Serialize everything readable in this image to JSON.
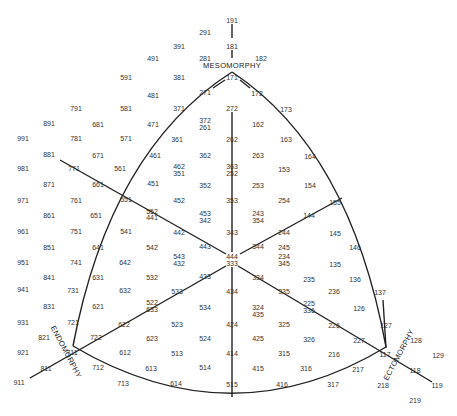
{
  "chart_data": {
    "type": "somatochart",
    "axes": {
      "top": "MESOMORPHY",
      "left": "ENDOMORPHY",
      "right": "ECTOMORPHY"
    },
    "center": "444 / 333",
    "points": [
      {
        "t": "191",
        "x": 232,
        "y": 20
      },
      {
        "t": "291",
        "x": 205,
        "y": 32
      },
      {
        "t": "181",
        "x": 232,
        "y": 46
      },
      {
        "t": "391",
        "x": 179,
        "y": 46
      },
      {
        "t": "491",
        "x": 153,
        "y": 58
      },
      {
        "t": "281",
        "x": 205,
        "y": 58
      },
      {
        "t": "182",
        "x": 261,
        "y": 58
      },
      {
        "t": "591",
        "x": 126,
        "y": 77
      },
      {
        "t": "381",
        "x": 179,
        "y": 77
      },
      {
        "t": "171",
        "x": 232,
        "y": 77
      },
      {
        "t": "481",
        "x": 153,
        "y": 95
      },
      {
        "t": "271",
        "x": 205,
        "y": 92
      },
      {
        "t": "172",
        "x": 257,
        "y": 93
      },
      {
        "t": "173",
        "x": 286,
        "y": 109
      },
      {
        "t": "791",
        "x": 76,
        "y": 108
      },
      {
        "t": "581",
        "x": 126,
        "y": 108
      },
      {
        "t": "371",
        "x": 179,
        "y": 108
      },
      {
        "t": "272",
        "x": 232,
        "y": 108
      },
      {
        "t": "891",
        "x": 49,
        "y": 123
      },
      {
        "t": "681",
        "x": 98,
        "y": 124
      },
      {
        "t": "471",
        "x": 153,
        "y": 124
      },
      {
        "t": "372",
        "x": 205,
        "y": 120
      },
      {
        "t": "261",
        "x": 205,
        "y": 127
      },
      {
        "t": "162",
        "x": 258,
        "y": 124
      },
      {
        "t": "991",
        "x": 23,
        "y": 138
      },
      {
        "t": "781",
        "x": 76,
        "y": 138
      },
      {
        "t": "571",
        "x": 126,
        "y": 138
      },
      {
        "t": "361",
        "x": 177,
        "y": 139
      },
      {
        "t": "262",
        "x": 232,
        "y": 139
      },
      {
        "t": "163",
        "x": 286,
        "y": 139
      },
      {
        "t": "881",
        "x": 49,
        "y": 154
      },
      {
        "t": "671",
        "x": 98,
        "y": 155
      },
      {
        "t": "461",
        "x": 155,
        "y": 155
      },
      {
        "t": "362",
        "x": 205,
        "y": 155
      },
      {
        "t": "263",
        "x": 258,
        "y": 155
      },
      {
        "t": "164",
        "x": 310,
        "y": 156
      },
      {
        "t": "981",
        "x": 23,
        "y": 168
      },
      {
        "t": "771",
        "x": 74,
        "y": 168
      },
      {
        "t": "561",
        "x": 120,
        "y": 168
      },
      {
        "t": "462",
        "x": 179,
        "y": 166
      },
      {
        "t": "351",
        "x": 179,
        "y": 173
      },
      {
        "t": "363",
        "x": 232,
        "y": 166
      },
      {
        "t": "252",
        "x": 232,
        "y": 173
      },
      {
        "t": "153",
        "x": 284,
        "y": 169
      },
      {
        "t": "871",
        "x": 49,
        "y": 184
      },
      {
        "t": "661",
        "x": 98,
        "y": 184
      },
      {
        "t": "451",
        "x": 153,
        "y": 183
      },
      {
        "t": "352",
        "x": 205,
        "y": 185
      },
      {
        "t": "253",
        "x": 258,
        "y": 185
      },
      {
        "t": "154",
        "x": 310,
        "y": 185
      },
      {
        "t": "971",
        "x": 23,
        "y": 200
      },
      {
        "t": "761",
        "x": 76,
        "y": 200
      },
      {
        "t": "551",
        "x": 126,
        "y": 199
      },
      {
        "t": "552",
        "x": 152,
        "y": 211
      },
      {
        "t": "441",
        "x": 152,
        "y": 217
      },
      {
        "t": "452",
        "x": 179,
        "y": 200
      },
      {
        "t": "353",
        "x": 232,
        "y": 200
      },
      {
        "t": "254",
        "x": 284,
        "y": 200
      },
      {
        "t": "155",
        "x": 335,
        "y": 202
      },
      {
        "t": "861",
        "x": 49,
        "y": 215
      },
      {
        "t": "651",
        "x": 96,
        "y": 215
      },
      {
        "t": "453",
        "x": 205,
        "y": 213
      },
      {
        "t": "342",
        "x": 205,
        "y": 220
      },
      {
        "t": "243",
        "x": 258,
        "y": 213
      },
      {
        "t": "354",
        "x": 258,
        "y": 220
      },
      {
        "t": "144",
        "x": 309,
        "y": 215
      },
      {
        "t": "961",
        "x": 23,
        "y": 231
      },
      {
        "t": "751",
        "x": 76,
        "y": 231
      },
      {
        "t": "541",
        "x": 126,
        "y": 231
      },
      {
        "t": "442",
        "x": 179,
        "y": 232
      },
      {
        "t": "343",
        "x": 232,
        "y": 232
      },
      {
        "t": "244",
        "x": 284,
        "y": 232
      },
      {
        "t": "145",
        "x": 335,
        "y": 233
      },
      {
        "t": "851",
        "x": 49,
        "y": 247
      },
      {
        "t": "641",
        "x": 98,
        "y": 247
      },
      {
        "t": "542",
        "x": 152,
        "y": 247
      },
      {
        "t": "443",
        "x": 205,
        "y": 246
      },
      {
        "t": "344",
        "x": 258,
        "y": 246
      },
      {
        "t": "245",
        "x": 284,
        "y": 247
      },
      {
        "t": "146",
        "x": 355,
        "y": 247
      },
      {
        "t": "543",
        "x": 179,
        "y": 256
      },
      {
        "t": "432",
        "x": 179,
        "y": 263
      },
      {
        "t": "444",
        "x": 232,
        "y": 256
      },
      {
        "t": "333",
        "x": 232,
        "y": 263
      },
      {
        "t": "234",
        "x": 284,
        "y": 256
      },
      {
        "t": "345",
        "x": 284,
        "y": 263
      },
      {
        "t": "951",
        "x": 23,
        "y": 262
      },
      {
        "t": "741",
        "x": 76,
        "y": 262
      },
      {
        "t": "642",
        "x": 125,
        "y": 262
      },
      {
        "t": "135",
        "x": 335,
        "y": 264
      },
      {
        "t": "841",
        "x": 49,
        "y": 277
      },
      {
        "t": "631",
        "x": 98,
        "y": 277
      },
      {
        "t": "532",
        "x": 152,
        "y": 277
      },
      {
        "t": "433",
        "x": 205,
        "y": 276
      },
      {
        "t": "334",
        "x": 258,
        "y": 277
      },
      {
        "t": "235",
        "x": 309,
        "y": 279
      },
      {
        "t": "136",
        "x": 355,
        "y": 279
      },
      {
        "t": "941",
        "x": 23,
        "y": 289
      },
      {
        "t": "731",
        "x": 73,
        "y": 290
      },
      {
        "t": "632",
        "x": 125,
        "y": 290
      },
      {
        "t": "533",
        "x": 177,
        "y": 291
      },
      {
        "t": "434",
        "x": 232,
        "y": 291
      },
      {
        "t": "335",
        "x": 284,
        "y": 291
      },
      {
        "t": "236",
        "x": 334,
        "y": 291
      },
      {
        "t": "137",
        "x": 380,
        "y": 292
      },
      {
        "t": "831",
        "x": 49,
        "y": 306
      },
      {
        "t": "621",
        "x": 98,
        "y": 306
      },
      {
        "t": "522",
        "x": 152,
        "y": 302
      },
      {
        "t": "633",
        "x": 152,
        "y": 309
      },
      {
        "t": "534",
        "x": 205,
        "y": 307
      },
      {
        "t": "324",
        "x": 258,
        "y": 307
      },
      {
        "t": "435",
        "x": 258,
        "y": 314
      },
      {
        "t": "225",
        "x": 309,
        "y": 303
      },
      {
        "t": "336",
        "x": 309,
        "y": 310
      },
      {
        "t": "126",
        "x": 359,
        "y": 308
      },
      {
        "t": "931",
        "x": 23,
        "y": 322
      },
      {
        "t": "721",
        "x": 73,
        "y": 322
      },
      {
        "t": "622",
        "x": 124,
        "y": 324
      },
      {
        "t": "523",
        "x": 177,
        "y": 324
      },
      {
        "t": "424",
        "x": 232,
        "y": 324
      },
      {
        "t": "325",
        "x": 284,
        "y": 324
      },
      {
        "t": "226",
        "x": 334,
        "y": 325
      },
      {
        "t": "127",
        "x": 386,
        "y": 325
      },
      {
        "t": "821",
        "x": 44,
        "y": 337
      },
      {
        "t": "722",
        "x": 96,
        "y": 337
      },
      {
        "t": "623",
        "x": 152,
        "y": 338
      },
      {
        "t": "524",
        "x": 205,
        "y": 338
      },
      {
        "t": "425",
        "x": 258,
        "y": 338
      },
      {
        "t": "326",
        "x": 309,
        "y": 339
      },
      {
        "t": "227",
        "x": 359,
        "y": 340
      },
      {
        "t": "128",
        "x": 416,
        "y": 340
      },
      {
        "t": "921",
        "x": 23,
        "y": 352
      },
      {
        "t": "711",
        "x": 72,
        "y": 352
      },
      {
        "t": "612",
        "x": 125,
        "y": 352
      },
      {
        "t": "513",
        "x": 177,
        "y": 353
      },
      {
        "t": "414",
        "x": 232,
        "y": 353
      },
      {
        "t": "315",
        "x": 284,
        "y": 353
      },
      {
        "t": "216",
        "x": 334,
        "y": 354
      },
      {
        "t": "117",
        "x": 385,
        "y": 354
      },
      {
        "t": "129",
        "x": 438,
        "y": 355
      },
      {
        "t": "811",
        "x": 46,
        "y": 368
      },
      {
        "t": "712",
        "x": 98,
        "y": 367
      },
      {
        "t": "613",
        "x": 151,
        "y": 368
      },
      {
        "t": "514",
        "x": 205,
        "y": 367
      },
      {
        "t": "415",
        "x": 258,
        "y": 368
      },
      {
        "t": "316",
        "x": 306,
        "y": 368
      },
      {
        "t": "217",
        "x": 358,
        "y": 369
      },
      {
        "t": "118",
        "x": 415,
        "y": 370
      },
      {
        "t": "911",
        "x": 19,
        "y": 382
      },
      {
        "t": "713",
        "x": 123,
        "y": 383
      },
      {
        "t": "614",
        "x": 176,
        "y": 383
      },
      {
        "t": "515",
        "x": 232,
        "y": 384
      },
      {
        "t": "416",
        "x": 282,
        "y": 384
      },
      {
        "t": "317",
        "x": 333,
        "y": 384
      },
      {
        "t": "218",
        "x": 383,
        "y": 385
      },
      {
        "t": "119",
        "x": 437,
        "y": 385
      },
      {
        "t": "219",
        "x": 415,
        "y": 400
      }
    ]
  }
}
